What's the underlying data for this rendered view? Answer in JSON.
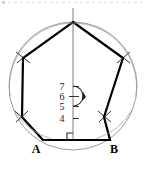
{
  "figure": {
    "background_color": "#ffffff",
    "top_edge_artifact": "faint-dotted-scanline",
    "colors": {
      "circle_stroke": "#8c8c8c",
      "polygon_stroke": "#000000",
      "axis_stroke": "#6e6e6e",
      "tick_stroke": "#333333",
      "arc_stroke": "#333333",
      "label_text": "#000000"
    }
  },
  "circle": {
    "name": "circumscribed-circle",
    "center_x": 73,
    "center_y": 86,
    "radius": 64,
    "stroke_width": 0.8
  },
  "polygon": {
    "name": "regular-heptagon",
    "sides": 7,
    "stroke_width": 2.2,
    "vertices": [
      {
        "label": "",
        "x": 73,
        "y": 22
      },
      {
        "label": "",
        "x": 123,
        "y": 58
      },
      {
        "label": "",
        "x": 104,
        "y": 117
      },
      {
        "label": "B",
        "x": 110,
        "y": 140
      },
      {
        "label": "A",
        "x": 43,
        "y": 140
      },
      {
        "label": "",
        "x": 22,
        "y": 117
      },
      {
        "label": "",
        "x": 23,
        "y": 58
      }
    ]
  },
  "construction_marks": {
    "name": "compass-arc-crosses",
    "note": "small X crossing marks at upper and mid vertices",
    "count": 4,
    "positions": [
      {
        "x": 23,
        "y": 57
      },
      {
        "x": 123,
        "y": 57
      },
      {
        "x": 9,
        "y": 99
      },
      {
        "x": 137,
        "y": 99
      }
    ]
  },
  "axis": {
    "name": "vertical-apothem-line",
    "x": 73,
    "y_top": 8,
    "y_bottom": 141,
    "stroke_width": 0.9
  },
  "ticks": {
    "name": "scale-ticks",
    "orientation": "vertical",
    "items": [
      {
        "label": "7",
        "y": 86,
        "tick_x1": 73,
        "tick_x2": 79
      },
      {
        "label": "6",
        "y": 96,
        "tick_x1": 70,
        "tick_x2": 79
      },
      {
        "label": "5",
        "y": 106,
        "tick_x1": 73,
        "tick_x2": 79
      },
      {
        "label": "4",
        "y": 118,
        "tick_x1": 73,
        "tick_x2": 79
      }
    ]
  },
  "angle_arc": {
    "name": "center-angle-arc",
    "center_x": 73,
    "center_y": 96,
    "radius": 10,
    "has_arrowhead": true,
    "arrow_x": 83,
    "arrow_y": 96
  },
  "right_angle": {
    "name": "right-angle-marker",
    "x": 67,
    "y": 134,
    "size": 6
  },
  "vertex_labels": [
    {
      "name": "vertex-label-a",
      "text": "A",
      "x": 36,
      "y": 153
    },
    {
      "name": "vertex-label-b",
      "text": "B",
      "x": 112,
      "y": 153
    }
  ],
  "base_segment": {
    "name": "segment-ab",
    "x1": 43,
    "y1": 140,
    "x2": 110,
    "y2": 140
  }
}
